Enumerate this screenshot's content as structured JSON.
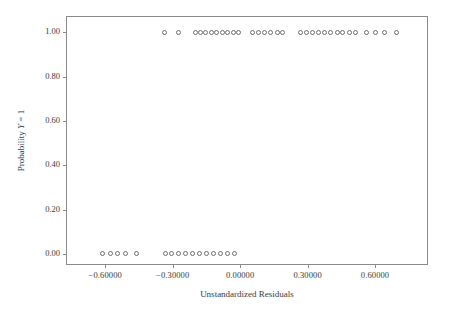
{
  "chart_data": {
    "type": "scatter",
    "title": "",
    "xlabel": "Unstandardized Residuals",
    "ylabel": "Probability Y = 1",
    "ylabel_parts": {
      "prefix": "Probability ",
      "italic": "Y",
      "suffix": " = 1"
    },
    "xlim": [
      -0.77,
      0.84
    ],
    "ylim": [
      -0.055,
      1.07
    ],
    "grid": false,
    "legend": null,
    "marker": "open-circle",
    "marker_color": "#6e6e6e",
    "xticks": [
      -0.6,
      -0.3,
      0.0,
      0.3,
      0.6
    ],
    "xticklabels": [
      "−0.60000",
      "−0.30000",
      "0.00000",
      "0.30000",
      "0.60000"
    ],
    "yticks": [
      0.0,
      0.2,
      0.4,
      0.6,
      0.8,
      1.0
    ],
    "yticklabels": [
      "0.00",
      "0.20",
      "0.40",
      "0.60",
      "0.80",
      "1.00"
    ],
    "series": [
      {
        "name": "observations",
        "x": [
          -0.61,
          -0.578,
          -0.545,
          -0.51,
          -0.463,
          -0.334,
          -0.304,
          -0.273,
          -0.243,
          -0.212,
          -0.181,
          -0.15,
          -0.118,
          -0.086,
          -0.054,
          -0.023,
          -0.335,
          -0.273,
          -0.198,
          -0.177,
          -0.152,
          -0.128,
          -0.104,
          -0.08,
          -0.056,
          -0.031,
          -0.007,
          0.056,
          0.083,
          0.11,
          0.137,
          0.164,
          0.19,
          0.268,
          0.296,
          0.323,
          0.35,
          0.377,
          0.404,
          0.431,
          0.457
        ],
        "y": [
          0,
          0,
          0,
          0,
          0,
          0,
          0,
          0,
          0,
          0,
          0,
          0,
          0,
          0,
          0,
          0,
          1,
          1,
          1,
          1,
          1,
          1,
          1,
          1,
          1,
          1,
          1,
          1,
          1,
          1,
          1,
          1,
          1,
          1,
          1,
          1,
          1,
          1,
          1,
          1,
          1
        ]
      }
    ],
    "points_y1_x": [
      -0.335,
      -0.273,
      -0.198,
      -0.177,
      -0.152,
      -0.128,
      -0.104,
      -0.08,
      -0.056,
      -0.031,
      -0.007,
      0.056,
      0.083,
      0.11,
      0.137,
      0.164,
      0.19,
      0.268,
      0.296,
      0.323,
      0.35,
      0.377,
      0.404,
      0.431,
      0.457,
      0.485,
      0.512,
      0.56,
      0.6,
      0.64,
      0.695
    ],
    "points_y0_x": [
      -0.61,
      -0.578,
      -0.545,
      -0.51,
      -0.463,
      -0.334,
      -0.304,
      -0.273,
      -0.243,
      -0.212,
      -0.181,
      -0.15,
      -0.118,
      -0.086,
      -0.054,
      -0.023
    ],
    "n_points_y1": 31,
    "n_points_y0": 16
  }
}
